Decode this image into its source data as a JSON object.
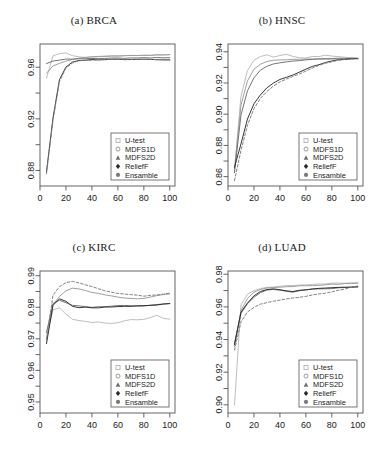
{
  "figure": {
    "width": 376,
    "height": 454,
    "background": "#ffffff",
    "layout": "2x2 grid of line charts"
  },
  "legend": {
    "entries": [
      {
        "label": "U-test",
        "marker": "square-marker-icon",
        "color": "#b9b9b9",
        "linestyle": "solid"
      },
      {
        "label": "MDFS1D",
        "marker": "circle-marker-icon",
        "color": "#9a9a9a",
        "linestyle": "solid"
      },
      {
        "label": "MDFS2D",
        "marker": "triangle-marker-icon",
        "color": "#6e6e6e",
        "linestyle": "solid"
      },
      {
        "label": "ReliefF",
        "marker": "diamond-marker-icon",
        "color": "#2b2b2b",
        "linestyle": "solid"
      },
      {
        "label": "Ensamble",
        "marker": "filled-circle-marker-icon",
        "color": "#7a7a7a",
        "linestyle": "dashed"
      }
    ]
  },
  "chart_data": [
    {
      "type": "line",
      "panel": "a",
      "title": "(a) BRCA",
      "xlabel": "",
      "ylabel": "",
      "xlim": [
        0,
        104
      ],
      "ylim": [
        0.868,
        0.978
      ],
      "xticks": [
        0,
        20,
        40,
        60,
        80,
        100
      ],
      "xticklabels": [
        "0",
        "20",
        "40",
        "60",
        "80",
        "100"
      ],
      "yticks": [
        0.88,
        0.92,
        0.96
      ],
      "yticklabels": [
        "0.88",
        "0.92",
        "0.96"
      ],
      "yminorticks": [
        0.9,
        0.94
      ],
      "grid": false,
      "legend_position": "bottom-right",
      "x": [
        5,
        10,
        15,
        20,
        25,
        30,
        35,
        40,
        45,
        50,
        55,
        60,
        65,
        70,
        75,
        80,
        85,
        90,
        95,
        100
      ],
      "series": [
        {
          "name": "U-test",
          "values": [
            0.9515,
            0.9688,
            0.9705,
            0.9712,
            0.969,
            0.968,
            0.9678,
            0.968,
            0.9682,
            0.9684,
            0.9685,
            0.9686,
            0.9688,
            0.969,
            0.9691,
            0.9692,
            0.9693,
            0.9694,
            0.9695,
            0.9696
          ]
        },
        {
          "name": "MDFS1D",
          "values": [
            0.9553,
            0.961,
            0.963,
            0.9648,
            0.9659,
            0.9669,
            0.9676,
            0.9681,
            0.9684,
            0.9686,
            0.9687,
            0.9688,
            0.9689,
            0.969,
            0.9691,
            0.9692,
            0.9693,
            0.9694,
            0.9695,
            0.9696
          ]
        },
        {
          "name": "MDFS2D",
          "values": [
            0.9628,
            0.9648,
            0.9656,
            0.9661,
            0.9663,
            0.9665,
            0.9666,
            0.9667,
            0.9668,
            0.9669,
            0.9669,
            0.967,
            0.967,
            0.9671,
            0.9671,
            0.9672,
            0.9672,
            0.9673,
            0.9673,
            0.9674
          ]
        },
        {
          "name": "ReliefF",
          "values": [
            0.879,
            0.9205,
            0.9502,
            0.9601,
            0.9638,
            0.9651,
            0.9656,
            0.9658,
            0.9659,
            0.966,
            0.966,
            0.9661,
            0.9661,
            0.9662,
            0.9662,
            0.9662,
            0.9661,
            0.966,
            0.9659,
            0.9658
          ]
        },
        {
          "name": "Ensamble",
          "values": [
            0.8775,
            0.919,
            0.9492,
            0.9596,
            0.9634,
            0.9648,
            0.9654,
            0.9657,
            0.9658,
            0.9659,
            0.966,
            0.966,
            0.9661,
            0.9661,
            0.9662,
            0.9662,
            0.9661,
            0.966,
            0.9659,
            0.9658
          ]
        }
      ]
    },
    {
      "type": "line",
      "panel": "b",
      "title": "(b) HNSC",
      "xlabel": "",
      "ylabel": "",
      "xlim": [
        0,
        104
      ],
      "ylim": [
        0.854,
        0.945
      ],
      "xticks": [
        0,
        20,
        40,
        60,
        80,
        100
      ],
      "xticklabels": [
        "0",
        "20",
        "40",
        "60",
        "80",
        "100"
      ],
      "yticks": [
        0.86,
        0.88,
        0.9,
        0.92,
        0.94
      ],
      "yticklabels": [
        "0.86",
        "0.88",
        "0.90",
        "0.92",
        "0.94"
      ],
      "yminorticks": [
        0.87,
        0.89,
        0.91,
        0.93
      ],
      "grid": false,
      "legend_position": "bottom-right",
      "x": [
        5,
        10,
        15,
        20,
        25,
        30,
        35,
        40,
        45,
        50,
        55,
        60,
        65,
        70,
        75,
        80,
        85,
        90,
        95,
        100
      ],
      "series": [
        {
          "name": "U-test",
          "values": [
            0.865,
            0.9115,
            0.928,
            0.9345,
            0.937,
            0.938,
            0.9368,
            0.9375,
            0.9382,
            0.9372,
            0.936,
            0.9362,
            0.937,
            0.9368,
            0.9378,
            0.9372,
            0.9368,
            0.9364,
            0.936,
            0.9358
          ]
        },
        {
          "name": "MDFS1D",
          "values": [
            0.864,
            0.9058,
            0.9215,
            0.929,
            0.9322,
            0.9338,
            0.9344,
            0.9348,
            0.935,
            0.9352,
            0.9353,
            0.9354,
            0.9355,
            0.9356,
            0.9357,
            0.9357,
            0.9358,
            0.9358,
            0.9358,
            0.9358
          ]
        },
        {
          "name": "MDFS2D",
          "values": [
            0.8625,
            0.8995,
            0.915,
            0.9235,
            0.9282,
            0.9308,
            0.9322,
            0.933,
            0.9336,
            0.934,
            0.9344,
            0.9347,
            0.935,
            0.9352,
            0.9354,
            0.9355,
            0.9356,
            0.9357,
            0.9357,
            0.9358
          ]
        },
        {
          "name": "ReliefF",
          "values": [
            0.866,
            0.881,
            0.8968,
            0.9068,
            0.9125,
            0.9168,
            0.92,
            0.9222,
            0.9238,
            0.9252,
            0.9268,
            0.9288,
            0.9305,
            0.9318,
            0.933,
            0.934,
            0.9348,
            0.9352,
            0.9355,
            0.9356
          ]
        },
        {
          "name": "Ensamble",
          "values": [
            0.8575,
            0.8768,
            0.8928,
            0.9035,
            0.91,
            0.9145,
            0.918,
            0.9205,
            0.9225,
            0.9242,
            0.9258,
            0.9275,
            0.9295,
            0.9312,
            0.9325,
            0.9336,
            0.9345,
            0.935,
            0.9354,
            0.9356
          ]
        }
      ]
    },
    {
      "type": "line",
      "panel": "c",
      "title": "(c) KIRC",
      "xlabel": "",
      "ylabel": "",
      "xlim": [
        0,
        104
      ],
      "ylim": [
        0.9465,
        0.9915
      ],
      "xticks": [
        0,
        20,
        40,
        60,
        80,
        100
      ],
      "xticklabels": [
        "0",
        "20",
        "40",
        "60",
        "80",
        "100"
      ],
      "yticks": [
        0.95,
        0.96,
        0.97,
        0.98,
        0.99
      ],
      "yticklabels": [
        "0.95",
        "0.96",
        "0.97",
        "0.98",
        "0.99"
      ],
      "yminorticks": [
        0.955,
        0.965,
        0.975,
        0.985
      ],
      "grid": false,
      "legend_position": "bottom-right",
      "x": [
        5,
        10,
        15,
        20,
        25,
        30,
        35,
        40,
        45,
        50,
        55,
        60,
        65,
        70,
        75,
        80,
        85,
        90,
        95,
        100
      ],
      "series": [
        {
          "name": "U-test",
          "values": [
            0.9705,
            0.9792,
            0.9798,
            0.9778,
            0.9762,
            0.9758,
            0.9756,
            0.9752,
            0.9754,
            0.975,
            0.9748,
            0.9752,
            0.9758,
            0.9762,
            0.976,
            0.9762,
            0.9768,
            0.9775,
            0.9766,
            0.9762
          ]
        },
        {
          "name": "MDFS1D",
          "values": [
            0.9696,
            0.9808,
            0.9835,
            0.9852,
            0.986,
            0.9858,
            0.9854,
            0.9848,
            0.9844,
            0.984,
            0.9836,
            0.9832,
            0.983,
            0.9828,
            0.9826,
            0.9828,
            0.9832,
            0.9836,
            0.984,
            0.9842
          ]
        },
        {
          "name": "MDFS2D",
          "values": [
            0.972,
            0.9812,
            0.9822,
            0.9815,
            0.9806,
            0.9804,
            0.9802,
            0.98,
            0.9801,
            0.9802,
            0.9804,
            0.9806,
            0.9805,
            0.9804,
            0.9804,
            0.9805,
            0.9806,
            0.9808,
            0.981,
            0.9812
          ]
        },
        {
          "name": "ReliefF",
          "values": [
            0.9685,
            0.9806,
            0.9826,
            0.9818,
            0.9802,
            0.9798,
            0.98,
            0.9799,
            0.9798,
            0.98,
            0.9801,
            0.9802,
            0.9803,
            0.9802,
            0.9804,
            0.9805,
            0.9806,
            0.9808,
            0.981,
            0.9812
          ]
        },
        {
          "name": "Ensamble",
          "values": [
            0.9698,
            0.9838,
            0.9866,
            0.9878,
            0.9882,
            0.9878,
            0.9872,
            0.9866,
            0.9858,
            0.9852,
            0.9848,
            0.9844,
            0.9842,
            0.984,
            0.9838,
            0.9836,
            0.9838,
            0.984,
            0.9842,
            0.9844
          ]
        }
      ]
    },
    {
      "type": "line",
      "panel": "d",
      "title": "(d) LUAD",
      "xlabel": "",
      "ylabel": "",
      "xlim": [
        0,
        104
      ],
      "ylim": [
        0.895,
        0.982
      ],
      "xticks": [
        0,
        20,
        40,
        60,
        80,
        100
      ],
      "xticklabels": [
        "0",
        "20",
        "40",
        "60",
        "80",
        "100"
      ],
      "yticks": [
        0.9,
        0.92,
        0.94,
        0.96,
        0.98
      ],
      "yticklabels": [
        "0.90",
        "0.92",
        "0.94",
        "0.96",
        "0.98"
      ],
      "yminorticks": [
        0.91,
        0.93,
        0.95,
        0.97
      ],
      "grid": false,
      "legend_position": "bottom-right",
      "x": [
        5,
        10,
        15,
        20,
        25,
        30,
        35,
        40,
        45,
        50,
        55,
        60,
        65,
        70,
        75,
        80,
        85,
        90,
        95,
        100
      ],
      "series": [
        {
          "name": "U-test",
          "values": [
            0.9,
            0.9612,
            0.968,
            0.97,
            0.9712,
            0.9718,
            0.9722,
            0.9726,
            0.973,
            0.9732,
            0.9734,
            0.9736,
            0.9738,
            0.974,
            0.9742,
            0.9744,
            0.9745,
            0.9746,
            0.9747,
            0.9748
          ]
        },
        {
          "name": "MDFS1D",
          "values": [
            0.9355,
            0.9578,
            0.9652,
            0.9692,
            0.9708,
            0.9716,
            0.972,
            0.9722,
            0.9724,
            0.9726,
            0.9728,
            0.973,
            0.9732,
            0.9734,
            0.9736,
            0.9738,
            0.974,
            0.9742,
            0.9744,
            0.9746
          ]
        },
        {
          "name": "MDFS2D",
          "values": [
            0.9378,
            0.956,
            0.9618,
            0.966,
            0.9688,
            0.9702,
            0.9708,
            0.9702,
            0.9696,
            0.9692,
            0.9698,
            0.9704,
            0.9708,
            0.971,
            0.9712,
            0.9714,
            0.9716,
            0.9718,
            0.972,
            0.9722
          ]
        },
        {
          "name": "ReliefF",
          "values": [
            0.9368,
            0.9568,
            0.9625,
            0.9668,
            0.9696,
            0.9708,
            0.9712,
            0.9706,
            0.97,
            0.9696,
            0.97,
            0.9706,
            0.971,
            0.9712,
            0.9714,
            0.9716,
            0.9718,
            0.972,
            0.9722,
            0.9724
          ]
        },
        {
          "name": "Ensamble",
          "values": [
            0.9335,
            0.9508,
            0.957,
            0.9598,
            0.9618,
            0.9628,
            0.9636,
            0.9642,
            0.9648,
            0.9654,
            0.966,
            0.9666,
            0.9672,
            0.9678,
            0.9684,
            0.9692,
            0.97,
            0.971,
            0.972,
            0.973
          ]
        }
      ]
    }
  ]
}
